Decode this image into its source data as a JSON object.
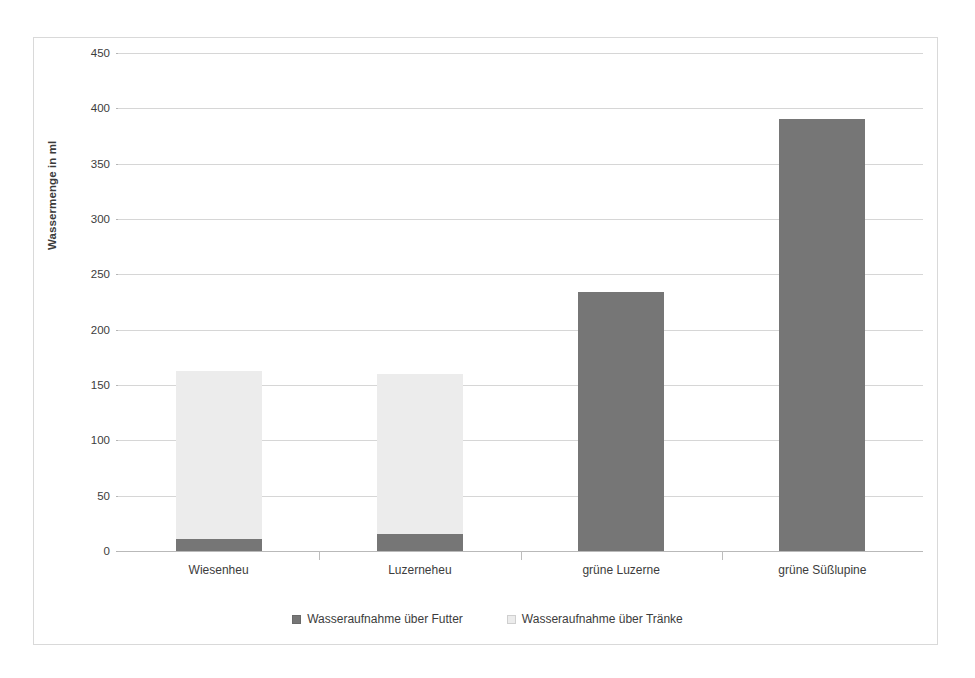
{
  "chart_data": {
    "type": "bar",
    "subtype": "stacked-bar",
    "title": "",
    "xlabel": "",
    "ylabel": "Wassermenge in ml",
    "ylim": [
      0,
      450
    ],
    "ytick_step": 50,
    "yticks": [
      450,
      400,
      350,
      300,
      250,
      200,
      150,
      100,
      50,
      0
    ],
    "ytick_labels": [
      "450",
      "400",
      "350",
      "300",
      "250",
      "200",
      "150",
      "100",
      "50",
      "0"
    ],
    "grid": true,
    "legend_position": "bottom",
    "categories": [
      "Wiesenheu",
      "Luzerneheu",
      "grüne Luzerne",
      "grüne Süßlupine"
    ],
    "series": [
      {
        "name": "Wasseraufnahme über Futter",
        "color": "#767676",
        "values": [
          11,
          15,
          234,
          390
        ]
      },
      {
        "name": "Wasseraufnahme über Tränke",
        "color": "#ececec",
        "values": [
          152,
          145,
          0,
          0
        ]
      }
    ],
    "totals": [
      163,
      160,
      234,
      390
    ]
  },
  "legend": {
    "items": [
      {
        "label": "Wasseraufnahme über Futter",
        "swatch": "futter"
      },
      {
        "label": "Wasseraufnahme über Tränke",
        "swatch": "traenke"
      }
    ]
  },
  "colors": {
    "futter": "#767676",
    "traenke": "#ececec",
    "gridline": "#d6d6d6",
    "frame": "#d9d9d9",
    "background": "#ffffff",
    "text": "#3c3c3c"
  }
}
